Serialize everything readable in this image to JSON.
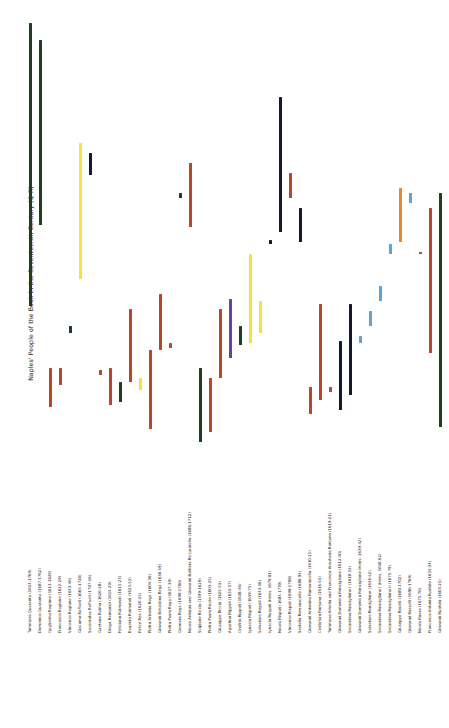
{
  "chart_data": {
    "type": "bar",
    "orientation": "vertical-range",
    "title": "Naples' People of the Book in the Seventeenth Century (Q-R)",
    "ylabel": "Naples' People of the Book in the Seventeenth Century (Q-R)",
    "xlabel": "",
    "grid": false,
    "legend": false,
    "ylim": [
      1570,
      1775
    ],
    "categories": [
      "Tommaso Quaranta (1654-1769)",
      "Domenico Quaranta (1687-1762)",
      "Guglielmo Ragione (1613-1629)",
      "Francesco Ragione (1622-1629)",
      "Vincenzo Ragione (1643-46)",
      "Giacomo Raffaeli (1665-1720)",
      "Sacerdotus Raffaeli (1707-16)",
      "Gaetano Raimo (1626-28)",
      "Diego Raimondi (1614-29)",
      "Feliciano Raimondi (1615-23)",
      "Eugenio Raimondi (1623-53)",
      "Felice Rea (1620-25)",
      "Pietro Antonio Rega (1604-36)",
      "Giovanni Berardino Rega (1636-59)",
      "Pietro Paolo Rega (1637-39)",
      "Gennaro Rega (1698-1700)",
      "Nicola Antonio and Giovanni Battista Riccardiello (1686-1712)",
      "Scipione Riccio (1599-1629)",
      "Pietro Paolo Riccio (1603-25)",
      "Giuseppe Riccio (1625-53)",
      "Agostino Rippoli (1633-57)",
      "Onofrio Rippoli (1638-46)",
      "Ignazio Rispoli (1639-75)",
      "Salvatore Rispoli (1643-56)",
      "Ignacio Ruspoli (Heirs, 1679-81)",
      "Nicola Rispoli (1684-1739)",
      "Vincenzo Rispoli (1698-1708)",
      "Sestelio Romanocello (1680-94)",
      "Giovanni Antonino Romanocello (1610-21)",
      "Cristofaro Romano (1616-55)",
      "Tommaso Amelio and Francesco Anastasio Romano (1619-21)",
      "Giovanni Domenico Ronciglione (1612-40)",
      "Secondino Ronciglione I (1618-55)",
      "Giovanni Domenico Ronciglione (Heirs, 1639-42)",
      "Salvatore Ronciglione (1656-52)",
      "Secondino Ronciglione I (Heirs, 1656-62)",
      "Secondino Ronciglione II (1675-79)",
      "Giuseppe Roselli (1680-1702)",
      "Giovanni Rosselli (1696-1769)",
      "Nicola Rosso (1675-76)",
      "Francesco Antonio Ruotolo (1635-34)",
      "Giovanni Ruotolo (1605-25)"
    ],
    "bars": [
      {
        "label": "Tommaso Quaranta (1654-1769)",
        "x": 6.5,
        "start": 1654,
        "end": 1769,
        "color": "#1f3d1f"
      },
      {
        "label": "Domenico Quaranta (1687-1762)",
        "x": 16.5,
        "start": 1687,
        "end": 1762,
        "color": "#1f3d1f"
      },
      {
        "label": "Guglielmo Ragione (1613-1629)",
        "x": 26.5,
        "start": 1613,
        "end": 1629,
        "color": "#b8472a"
      },
      {
        "label": "Francesco Ragione (1622-29)",
        "x": 36.5,
        "start": 1622,
        "end": 1629,
        "color": "#b8472a"
      },
      {
        "label": "Vincenzo Ragione (1643-46)",
        "x": 46.5,
        "start": 1643,
        "end": 1646,
        "color": "#1f3d1f"
      },
      {
        "label": "Giacomo Raffaeli (1665-1720)",
        "x": 56.5,
        "start": 1665,
        "end": 1720,
        "color": "#f7e13a"
      },
      {
        "label": "Sacerdotus Raffaeli (1707-16)",
        "x": 66.5,
        "start": 1707,
        "end": 1716,
        "color": "#15192e"
      },
      {
        "label": "Gaetano Raimo (1626-28)",
        "x": 76.5,
        "start": 1626,
        "end": 1628,
        "color": "#b8472a"
      },
      {
        "label": "Diego Raimondi (1614-29)",
        "x": 86.5,
        "start": 1614,
        "end": 1629,
        "color": "#b8472a"
      },
      {
        "label": "Feliciano Raimondi (1615-23)",
        "x": 96.5,
        "start": 1615,
        "end": 1623,
        "color": "#1f3d1f"
      },
      {
        "label": "Eugenio Raimondi (1623-53)",
        "x": 106.5,
        "start": 1623,
        "end": 1653,
        "color": "#b8472a"
      },
      {
        "label": "Felice Rea (1620-25)",
        "x": 116.5,
        "start": 1620,
        "end": 1625,
        "color": "#f7e13a"
      },
      {
        "label": "Pietro Antonio Rega (1604-36)",
        "x": 126.5,
        "start": 1604,
        "end": 1636,
        "color": "#b8472a"
      },
      {
        "label": "Giovanni Berardino Rega (1636-59)",
        "x": 136.5,
        "start": 1636,
        "end": 1659,
        "color": "#b8472a"
      },
      {
        "label": "Pietro Paolo Rega (1637-39)",
        "x": 146.5,
        "start": 1637,
        "end": 1639,
        "color": "#b8472a"
      },
      {
        "label": "Gennaro Rega (1698-1700)",
        "x": 156.5,
        "start": 1698,
        "end": 1700,
        "color": "#1f3d1f"
      },
      {
        "label": "Nicola Antonio and Giovanni Battista Riccardiello (1686-1712)",
        "x": 166.5,
        "start": 1686,
        "end": 1712,
        "color": "#b8472a"
      },
      {
        "label": "Scipione Riccio (1599-1629)",
        "x": 176.5,
        "start": 1599,
        "end": 1629,
        "color": "#1f3d1f"
      },
      {
        "label": "Pietro Paolo Riccio (1603-25)",
        "x": 186.5,
        "start": 1603,
        "end": 1625,
        "color": "#b8472a"
      },
      {
        "label": "Giuseppe Riccio (1625-53)",
        "x": 196.5,
        "start": 1625,
        "end": 1653,
        "color": "#b8472a"
      },
      {
        "label": "Agostino Rippoli (1633-57)",
        "x": 206.5,
        "start": 1633,
        "end": 1657,
        "color": "#6b3f9e"
      },
      {
        "label": "Onofrio Rippoli (1638-46)",
        "x": 216.5,
        "start": 1638,
        "end": 1646,
        "color": "#1f3d1f"
      },
      {
        "label": "Ignazio Rispoli (1639-75)",
        "x": 226.5,
        "start": 1639,
        "end": 1675,
        "color": "#f7e13a"
      },
      {
        "label": "Salvatore Rispoli (1643-56)",
        "x": 236.5,
        "start": 1643,
        "end": 1656,
        "color": "#f7e13a"
      },
      {
        "label": "Ignacio Ruspoli (Heirs, 1679-81)",
        "x": 246.5,
        "start": 1679,
        "end": 1681,
        "color": "#15192e"
      },
      {
        "label": "Nicola Rispoli (1684-1739)",
        "x": 256.5,
        "start": 1684,
        "end": 1739,
        "color": "#15192e"
      },
      {
        "label": "Vincenzo Rispoli (1698-1708)",
        "x": 266.5,
        "start": 1698,
        "end": 1708,
        "color": "#b8472a"
      },
      {
        "label": "Sestelio Romanocello (1680-94)",
        "x": 276.5,
        "start": 1680,
        "end": 1694,
        "color": "#15192e"
      },
      {
        "label": "Giovanni Antonino Romanocello (1610-21)",
        "x": 286.5,
        "start": 1610,
        "end": 1621,
        "color": "#b8472a"
      },
      {
        "label": "Cristofaro Romano (1616-55)",
        "x": 296.5,
        "start": 1616,
        "end": 1655,
        "color": "#b8472a"
      },
      {
        "label": "Tommaso Amelio and Francesco Anastasio Romano (1619-21)",
        "x": 306.5,
        "start": 1619,
        "end": 1621,
        "color": "#b8472a"
      },
      {
        "label": "Giovanni Domenico Ronciglione (1612-40)",
        "x": 316.5,
        "start": 1612,
        "end": 1640,
        "color": "#15192e"
      },
      {
        "label": "Secondino Ronciglione I (1618-55)",
        "x": 326.5,
        "start": 1618,
        "end": 1655,
        "color": "#15192e"
      },
      {
        "label": "Giovanni Domenico Ronciglione (Heirs, 1639-42)",
        "x": 336.5,
        "start": 1639,
        "end": 1642,
        "color": "#5ba3dd"
      },
      {
        "label": "Salvatore Ronciglione (1656-52)",
        "x": 346.5,
        "start": 1646,
        "end": 1652,
        "color": "#5ba3dd"
      },
      {
        "label": "Secondino Ronciglione I (Heirs, 1656-62)",
        "x": 356.5,
        "start": 1656,
        "end": 1662,
        "color": "#5ba3dd"
      },
      {
        "label": "Secondino Ronciglione II (1675-79)",
        "x": 366.5,
        "start": 1675,
        "end": 1679,
        "color": "#5ba3dd"
      },
      {
        "label": "Giuseppe Roselli (1680-1702)",
        "x": 376.5,
        "start": 1680,
        "end": 1702,
        "color": "#e8882e"
      },
      {
        "label": "Giovanni Rosselli (1696-1769)",
        "x": 386.5,
        "start": 1696,
        "end": 1700,
        "color": "#5ba3dd"
      },
      {
        "label": "Nicola Rosso (1675-76)",
        "x": 396.5,
        "start": 1675,
        "end": 1676,
        "color": "#b8472a"
      },
      {
        "label": "Francesco Antonio Ruotolo (1635-34)",
        "x": 406.5,
        "start": 1635,
        "end": 1694,
        "color": "#b8472a"
      },
      {
        "label": "Giovanni Ruotolo (1605-25)",
        "x": 416.5,
        "start": 1605,
        "end": 1700,
        "color": "#1f3d1f"
      }
    ],
    "colors": {
      "dark_green": "#1f3d1f",
      "brick_red": "#b8472a",
      "yellow": "#f7e13a",
      "navy": "#15192e",
      "purple": "#6b3f9e",
      "light_blue": "#5ba3dd",
      "orange": "#e8882e"
    }
  }
}
